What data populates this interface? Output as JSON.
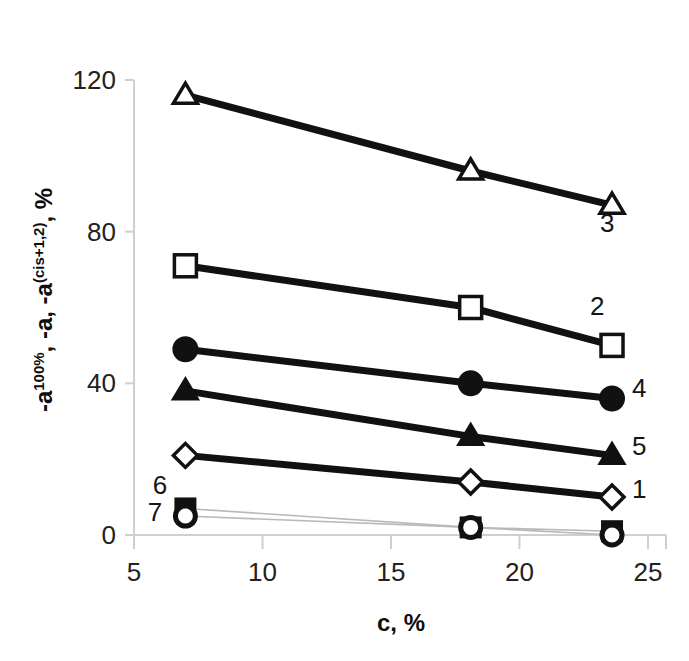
{
  "chart_data": {
    "type": "line",
    "title": "",
    "subtitle": "",
    "xlabel": "c, %",
    "ylabel": "-a^100%, -a, -a^(cis+1,2), %",
    "ylabel_parts": {
      "p1": "-a",
      "p1_sup": "100%",
      "p2": ", -a, -a",
      "p2_sup": "(cis+1,2)",
      "p3": ", %"
    },
    "x": [
      7.0,
      18.1,
      23.6
    ],
    "xlim": [
      5,
      25
    ],
    "ylim": [
      0,
      120
    ],
    "xticks": [
      5,
      10,
      15,
      20,
      25
    ],
    "yticks": [
      0,
      40,
      80,
      120
    ],
    "xtick_labels": [
      "5",
      "10",
      "15",
      "20",
      "25"
    ],
    "ytick_labels": [
      "0",
      "40",
      "80",
      "120"
    ],
    "grid": false,
    "legend": "inline-series-numbers",
    "series": [
      {
        "name": "1",
        "label": "1",
        "marker": "open-diamond",
        "style": "solid",
        "values": [
          21,
          14,
          10
        ]
      },
      {
        "name": "2",
        "label": "2",
        "marker": "open-square",
        "style": "solid",
        "values": [
          71,
          60,
          50
        ]
      },
      {
        "name": "3",
        "label": "3",
        "marker": "open-triangle",
        "style": "solid",
        "values": [
          116,
          96,
          87
        ]
      },
      {
        "name": "4",
        "label": "4",
        "marker": "filled-circle",
        "style": "solid",
        "values": [
          49,
          40,
          36
        ]
      },
      {
        "name": "5",
        "label": "5",
        "marker": "filled-triangle",
        "style": "solid",
        "values": [
          38,
          26,
          21
        ]
      },
      {
        "name": "6",
        "label": "6",
        "marker": "filled-square",
        "style": "faint",
        "values": [
          7,
          2,
          1
        ]
      },
      {
        "name": "7",
        "label": "7",
        "marker": "open-circle",
        "style": "faint",
        "values": [
          5,
          2,
          0
        ]
      }
    ],
    "colors": {
      "line": "#111111",
      "faint_line": "#b9b9b9",
      "axis": "#cfcfcf",
      "text": "#1a1a1a"
    }
  },
  "annotations": {
    "right_labels": [
      {
        "text": "3",
        "x": 600,
        "y": 232
      },
      {
        "text": "2",
        "x": 590,
        "y": 315
      },
      {
        "text": "4",
        "x": 632,
        "y": 397
      },
      {
        "text": "5",
        "x": 632,
        "y": 455
      },
      {
        "text": "1",
        "x": 632,
        "y": 498
      }
    ],
    "left_labels": [
      {
        "text": "6",
        "x": 160,
        "y": 494
      },
      {
        "text": "7",
        "x": 155,
        "y": 521
      }
    ]
  }
}
